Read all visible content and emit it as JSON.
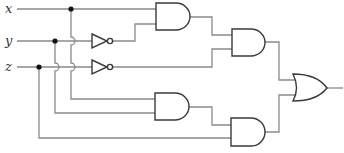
{
  "diagram": {
    "type": "logic-circuit",
    "inputs": [
      {
        "id": "x",
        "label": "x"
      },
      {
        "id": "y",
        "label": "y"
      },
      {
        "id": "z",
        "label": "z"
      }
    ],
    "gates": [
      {
        "id": "not1",
        "type": "NOT",
        "input": "y"
      },
      {
        "id": "not2",
        "type": "NOT",
        "input": "z"
      },
      {
        "id": "and1",
        "type": "AND",
        "inputs": [
          "x",
          "not1"
        ]
      },
      {
        "id": "and2",
        "type": "AND",
        "inputs": [
          "and1",
          "not2"
        ]
      },
      {
        "id": "and3",
        "type": "AND",
        "inputs": [
          "x",
          "y"
        ]
      },
      {
        "id": "and4",
        "type": "AND",
        "inputs": [
          "and3",
          "z"
        ]
      },
      {
        "id": "or1",
        "type": "OR",
        "inputs": [
          "and2",
          "and4"
        ]
      }
    ],
    "output": "or1",
    "colors": {
      "wire": "#8a8a8a",
      "gate_outline": "#3a3a3a",
      "junction_dot": "#111111",
      "background": "#ffffff"
    }
  }
}
